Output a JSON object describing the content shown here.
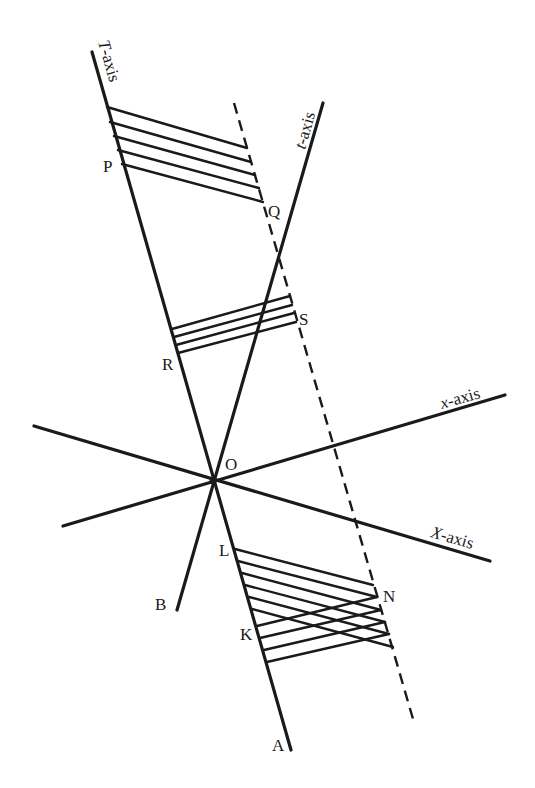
{
  "figure": {
    "axes": {
      "T_axis": {
        "label_italic": "T",
        "label_rest": "-axis",
        "from": [
          92,
          52
        ],
        "to": [
          291,
          750
        ]
      },
      "t_axis": {
        "label_italic": "t",
        "label_rest": "-axis",
        "from": [
          323,
          103
        ],
        "to": [
          177,
          610
        ]
      },
      "x_axis": {
        "label_italic": "x",
        "label_rest": "-axis",
        "from": [
          63,
          526
        ],
        "to": [
          505,
          395
        ]
      },
      "X_axis": {
        "label_italic": "X",
        "label_rest": "-axis",
        "from": [
          34,
          426
        ],
        "to": [
          490,
          561
        ]
      }
    },
    "dashed_line": {
      "from": [
        234,
        103
      ],
      "to": [
        413,
        719
      ]
    },
    "points": {
      "O": "O",
      "P": "P",
      "Q": "Q",
      "R": "R",
      "S": "S",
      "L": "L",
      "N": "N",
      "K": "K",
      "A": "A",
      "B": "B"
    },
    "hatch_groups": {
      "top_PQ": {
        "count": 5,
        "direction": "parallel to X-axis"
      },
      "middle_RS": {
        "count": 4,
        "direction": "parallel to x-axis"
      },
      "bottom_LN": {
        "count": 6,
        "direction": "parallel to X-axis"
      },
      "bottom_KN": {
        "count": 4,
        "direction": "parallel to x-axis"
      }
    }
  }
}
